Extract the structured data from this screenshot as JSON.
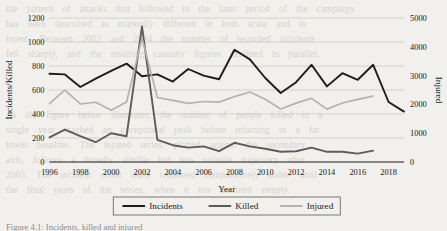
{
  "background_text": {
    "lines": "the  pattern  of  attacks  that  followed  in  the  later  period  of  the  campaign\nhas  been  described  as  markedly  different  in  both  scale  and  in\nintent.  Between  2002  and  2004  the  number  of  recorded  incidents\nfell  sharply,  and  the  resulting  casualty  figures  declined  in  parallel.\n\n\n\nAs  the  figure  below  illustrates,  the  number  of  people  killed  in  a\nsingle  year  reached  an  exceptional  peak  before  returning  to  a  far\nlower  baseline.  The  injured  series,  plotted  against  the  secondary\naxis,  follows  a  broadly  similar  but  less  volatile  trajectory  after\n2003.  The  incident  count  itself  remained  comparatively  stable  until\nthe  final  years  of  the  series,  when  it  too  declined  steeply."
  },
  "figure_caption": "Figure 4.1: Incidents, killed and injured",
  "chart_data": {
    "type": "line",
    "title": "",
    "xlabel": "Year",
    "ylabel": "Incidents/Killed",
    "y2label": "Injured",
    "xlim": [
      1996,
      2019
    ],
    "ylim": [
      0,
      1200
    ],
    "y2lim": [
      0,
      5000
    ],
    "yticks": [
      0,
      200,
      400,
      600,
      800,
      1000,
      1200
    ],
    "y2ticks": [
      0,
      1000,
      2000,
      3000,
      4000,
      5000
    ],
    "xticks": [
      1996,
      1998,
      2000,
      2002,
      2004,
      2006,
      2008,
      2010,
      2012,
      2014,
      2016,
      2018
    ],
    "grid": true,
    "legend_position": "bottom",
    "colors": {
      "incidents": "#1c1c1c",
      "killed": "#5c5c5c",
      "injured": "#b3b3b3"
    },
    "series": [
      {
        "name": "Incidents",
        "axis": "left",
        "color": "#1c1c1c",
        "x": [
          1996,
          1997,
          1998,
          1999,
          2000,
          2001,
          2002,
          2003,
          2004,
          2005,
          2006,
          2007,
          2008,
          2009,
          2010,
          2011,
          2012,
          2013,
          2014,
          2015,
          2016,
          2017,
          2018,
          2019
        ],
        "values": [
          735,
          730,
          625,
          695,
          760,
          820,
          715,
          730,
          670,
          775,
          720,
          690,
          935,
          855,
          700,
          575,
          665,
          810,
          630,
          740,
          685,
          810,
          500,
          420
        ]
      },
      {
        "name": "Killed",
        "axis": "left",
        "color": "#5c5c5c",
        "x": [
          1996,
          1997,
          1998,
          1999,
          2000,
          2001,
          2002,
          2003,
          2004,
          2005,
          2006,
          2007,
          2008,
          2009,
          2010,
          2011,
          2012,
          2013,
          2014,
          2015,
          2016,
          2017
        ],
        "values": [
          205,
          270,
          215,
          165,
          240,
          215,
          1130,
          185,
          140,
          120,
          130,
          90,
          160,
          130,
          110,
          85,
          90,
          120,
          85,
          85,
          70,
          95
        ]
      },
      {
        "name": "Injured",
        "axis": "right",
        "color": "#b3b3b3",
        "x": [
          1996,
          1997,
          1998,
          1999,
          2000,
          2001,
          2002,
          2003,
          2004,
          2005,
          2006,
          2007,
          2008,
          2009,
          2010,
          2011,
          2012,
          2013,
          2014,
          2015,
          2016,
          2017
        ],
        "values": [
          2030,
          2495,
          2015,
          2075,
          1795,
          2085,
          4300,
          2240,
          2140,
          2035,
          2100,
          2080,
          2270,
          2430,
          2180,
          1840,
          2045,
          2210,
          1835,
          2050,
          2175,
          2290
        ]
      }
    ]
  }
}
